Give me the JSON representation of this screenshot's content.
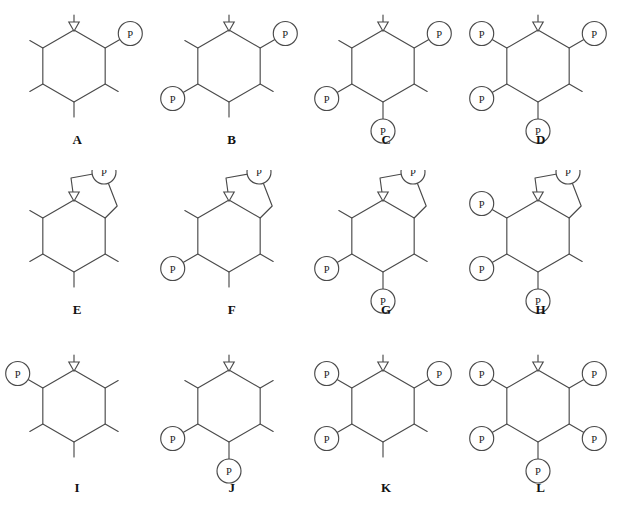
{
  "figure": {
    "rows": 3,
    "columns": 4,
    "substituent_label": "P",
    "ring_atom_marker": "open-down-triangle",
    "ink_color": "#4a4a4a",
    "label_color": "#111111",
    "background_color": "#ffffff"
  },
  "structures": [
    {
      "id": "A",
      "label": "A",
      "ring": "six-membered",
      "has_fused_five_ring": false,
      "p_count": 1,
      "p_positions": [
        "top-right"
      ],
      "stub_positions": [
        "top-apex",
        "top-left",
        "bottom-left",
        "bottom-right",
        "bottom-apex"
      ]
    },
    {
      "id": "B",
      "label": "B",
      "ring": "six-membered",
      "has_fused_five_ring": false,
      "p_count": 2,
      "p_positions": [
        "top-right",
        "bottom-left"
      ],
      "stub_positions": [
        "top-apex",
        "top-left",
        "bottom-right",
        "bottom-apex"
      ]
    },
    {
      "id": "C",
      "label": "C",
      "ring": "six-membered",
      "has_fused_five_ring": false,
      "p_count": 3,
      "p_positions": [
        "top-right",
        "bottom-left",
        "bottom-apex"
      ],
      "stub_positions": [
        "top-apex",
        "top-left",
        "bottom-right"
      ]
    },
    {
      "id": "D",
      "label": "D",
      "ring": "six-membered",
      "has_fused_five_ring": false,
      "p_count": 4,
      "p_positions": [
        "top-left",
        "top-right",
        "bottom-left",
        "bottom-apex"
      ],
      "stub_positions": [
        "top-apex",
        "bottom-right"
      ]
    },
    {
      "id": "E",
      "label": "E",
      "ring": "six-membered",
      "has_fused_five_ring": true,
      "p_count": 1,
      "p_positions": [
        "five-ring-top"
      ],
      "stub_positions": [
        "top-left",
        "bottom-left",
        "bottom-right",
        "bottom-apex"
      ]
    },
    {
      "id": "F",
      "label": "F",
      "ring": "six-membered",
      "has_fused_five_ring": true,
      "p_count": 2,
      "p_positions": [
        "five-ring-top",
        "bottom-left"
      ],
      "stub_positions": [
        "top-left",
        "bottom-right",
        "bottom-apex"
      ]
    },
    {
      "id": "G",
      "label": "G",
      "ring": "six-membered",
      "has_fused_five_ring": true,
      "p_count": 3,
      "p_positions": [
        "five-ring-top",
        "bottom-left",
        "bottom-apex"
      ],
      "stub_positions": [
        "top-left",
        "bottom-right"
      ]
    },
    {
      "id": "H",
      "label": "H",
      "ring": "six-membered",
      "has_fused_five_ring": true,
      "p_count": 4,
      "p_positions": [
        "five-ring-top",
        "top-left",
        "bottom-left",
        "bottom-apex"
      ],
      "stub_positions": [
        "bottom-right"
      ]
    },
    {
      "id": "I",
      "label": "I",
      "ring": "six-membered",
      "has_fused_five_ring": false,
      "p_count": 1,
      "p_positions": [
        "top-left"
      ],
      "stub_positions": [
        "top-apex",
        "top-right",
        "bottom-left",
        "bottom-right",
        "bottom-apex"
      ]
    },
    {
      "id": "J",
      "label": "J",
      "ring": "six-membered",
      "has_fused_five_ring": false,
      "p_count": 2,
      "p_positions": [
        "bottom-left",
        "bottom-apex"
      ],
      "stub_positions": [
        "top-apex",
        "top-left",
        "top-right",
        "bottom-right"
      ]
    },
    {
      "id": "K",
      "label": "K",
      "ring": "six-membered",
      "has_fused_five_ring": false,
      "p_count": 3,
      "p_positions": [
        "top-left",
        "top-right",
        "bottom-left"
      ],
      "stub_positions": [
        "top-apex",
        "bottom-right",
        "bottom-apex"
      ]
    },
    {
      "id": "L",
      "label": "L",
      "ring": "six-membered",
      "has_fused_five_ring": false,
      "p_count": 5,
      "p_positions": [
        "top-left",
        "top-right",
        "bottom-left",
        "bottom-right",
        "bottom-apex"
      ],
      "stub_positions": [
        "top-apex"
      ]
    }
  ]
}
